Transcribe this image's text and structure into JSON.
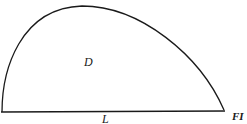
{
  "figure": {
    "region_label": "D",
    "base_label": "L",
    "figure_caption_fragment": "FI",
    "stroke_color": "#1a1a1a",
    "background_color": "#ffffff"
  }
}
